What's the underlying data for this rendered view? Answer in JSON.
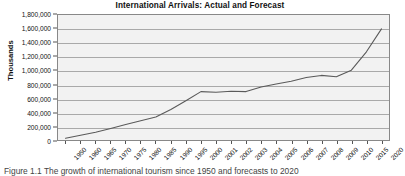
{
  "chart_data": {
    "type": "line",
    "title": "International Arrivals: Actual and Forecast",
    "xlabel": "",
    "ylabel": "Thousands",
    "ylim": [
      0,
      1800000
    ],
    "ytick_step": 200000,
    "grid": true,
    "legend": null,
    "legend_position": "none",
    "categories": [
      "1950",
      "1960",
      "1965",
      "1970",
      "1975",
      "1980",
      "1985",
      "1990",
      "1995",
      "2000",
      "2001",
      "2002",
      "2003",
      "2004",
      "2005",
      "2006",
      "2007",
      "2008",
      "2009",
      "2010",
      "2015",
      "2020"
    ],
    "values": [
      25000,
      69000,
      113000,
      166000,
      222000,
      278000,
      330000,
      440000,
      565000,
      697000,
      688000,
      703000,
      697000,
      763000,
      807000,
      847000,
      900000,
      930000,
      910000,
      1006000,
      1270000,
      1600000
    ],
    "ytick_labels": [
      "1,800,000",
      "1,600,000",
      "1,400,000",
      "1,200,000",
      "1,000,000",
      "800,000",
      "600,000",
      "400,000",
      "200,000",
      "0"
    ],
    "series_color": "#5a5a5a",
    "plot_background": "#f2f2f2",
    "gridline_color": "#a9a9a9",
    "axis_color": "#888888"
  },
  "caption": {
    "text": "Figure 1.1  The growth of international tourism since 1950 and forecasts to 2020"
  }
}
